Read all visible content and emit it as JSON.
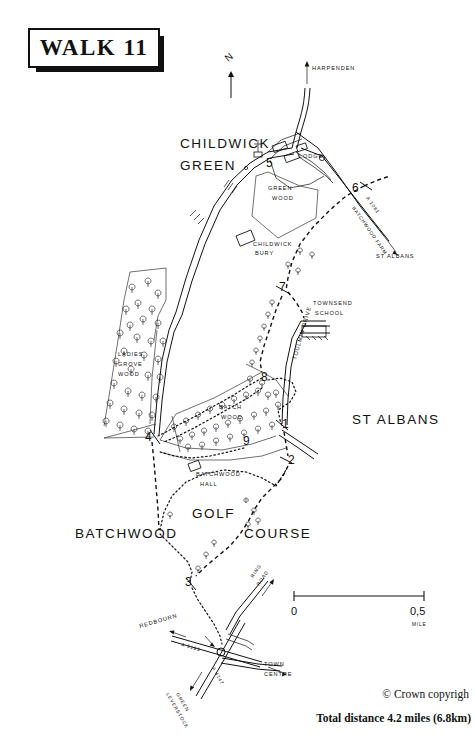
{
  "title": {
    "text": "WALK 11"
  },
  "compass": {
    "label": "N"
  },
  "credits": {
    "copyright": "© Crown copyrigh",
    "total_distance": "Total distance 4.2 miles (6.8km)"
  },
  "scale_bar": {
    "start": "0",
    "end": "0,5",
    "unit": "MILE"
  },
  "place_labels": [
    {
      "name": "childwick-green",
      "text_line1": "CHILDWICK",
      "text_line2": "GREEN"
    },
    {
      "name": "st-albans-area",
      "text": "ST ALBANS"
    },
    {
      "name": "batchwood",
      "text": "BATCHWOOD"
    },
    {
      "name": "golf",
      "text": "GOLF"
    },
    {
      "name": "course",
      "text": "COURSE"
    }
  ],
  "minor_labels": [
    {
      "name": "green-wood",
      "line1": "GREEN",
      "line2": "WOOD"
    },
    {
      "name": "lodge",
      "text": "LODGE"
    },
    {
      "name": "childwick-bury",
      "line1": "CHILDWICK",
      "line2": "BURY"
    },
    {
      "name": "ladies-grove-wood",
      "line1": "LADIES",
      "line2": "GROVE",
      "line3": "WOOD"
    },
    {
      "name": "batch-wood",
      "line1": "BATCH",
      "line2": "WOOD"
    },
    {
      "name": "townsend-school",
      "line1": "TOWNSEND",
      "line2": "SCHOOL"
    },
    {
      "name": "batchwood-hall",
      "line1": "BATCHWOOD",
      "line2": "HALL"
    },
    {
      "name": "toulmin-drive",
      "text": "TOULMIN DRIVE"
    },
    {
      "name": "batchwood-farm",
      "text": "BATCHWOOD FARM"
    }
  ],
  "direction_labels": [
    {
      "name": "harpenden",
      "text": "HARPENDEN"
    },
    {
      "name": "st-albans-arrow",
      "text": "ST ALBANS"
    },
    {
      "name": "redbourn",
      "text": "REDBOURN"
    },
    {
      "name": "town-centre",
      "line1": "TOWN",
      "line2": "CENTRE"
    },
    {
      "name": "leverstock-green",
      "line1": "LEVERSTOCK",
      "line2": "GREEN"
    },
    {
      "name": "ring-road",
      "line1": "RING",
      "line2": "ROAD"
    }
  ],
  "road_numbers": [
    {
      "name": "a1081",
      "text": "A 1081"
    },
    {
      "name": "a5183-west",
      "text": "A 5183"
    },
    {
      "name": "a4147",
      "text": "A 4147"
    }
  ],
  "waypoints": [
    {
      "id": "1",
      "x": 282,
      "y": 428
    },
    {
      "id": "2",
      "x": 288,
      "y": 464
    },
    {
      "id": "3",
      "x": 189,
      "y": 583
    },
    {
      "id": "4",
      "x": 149,
      "y": 437
    },
    {
      "id": "5",
      "x": 271,
      "y": 163
    },
    {
      "id": "6",
      "x": 355,
      "y": 188
    },
    {
      "id": "7",
      "x": 283,
      "y": 288
    },
    {
      "id": "8",
      "x": 265,
      "y": 378
    },
    {
      "id": "9",
      "x": 247,
      "y": 441
    }
  ],
  "colors": {
    "ink": "#111111",
    "paper": "#ffffff"
  }
}
